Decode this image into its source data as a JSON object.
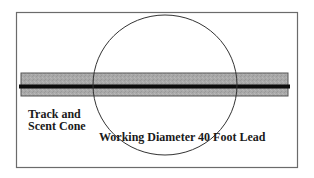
{
  "diagram": {
    "frame": {
      "x": 16,
      "y": 12,
      "width": 282,
      "height": 156,
      "stroke": "#6b6b6b"
    },
    "track_band": {
      "x": 21,
      "y": 73,
      "width": 267,
      "height": 23,
      "fill": "#a8a8a8",
      "stroke": "#555555"
    },
    "track_line": {
      "x1": 19,
      "x2": 290,
      "y": 86.5,
      "thickness": 4,
      "color": "#0d0d0d"
    },
    "working_circle": {
      "cx": 165,
      "cy": 85,
      "rx": 72,
      "ry": 70,
      "stroke": "#333333"
    },
    "labels": {
      "track_line1": "Track and",
      "track_line2": "Scent Cone",
      "working_diameter": "Working Diameter 40 Foot Lead"
    }
  }
}
